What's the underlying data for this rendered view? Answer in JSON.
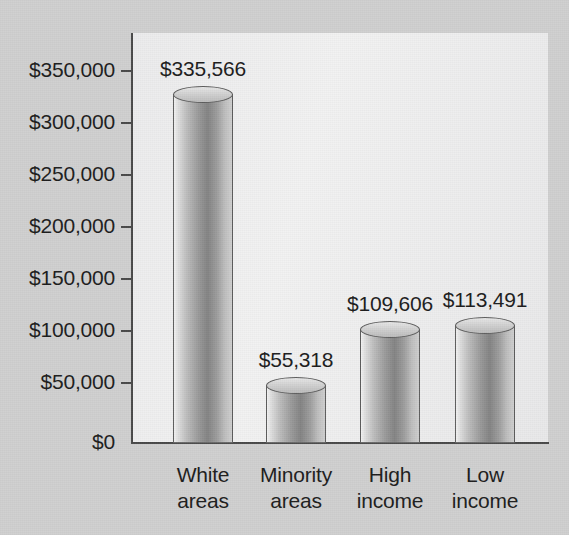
{
  "chart_data": {
    "type": "bar",
    "title": "",
    "subtitle": "",
    "xlabel": "",
    "ylabel": "",
    "categories": [
      "White areas",
      "Minority areas",
      "High income",
      "Low income"
    ],
    "category_lines": [
      [
        "White",
        "areas"
      ],
      [
        "Minority",
        "areas"
      ],
      [
        "High",
        "income"
      ],
      [
        "Low",
        "income"
      ]
    ],
    "values": [
      335566,
      55318,
      109606,
      113491
    ],
    "value_labels": [
      "$335,566",
      "$55,318",
      "$109,606",
      "$113,491"
    ],
    "ylim": [
      0,
      375000
    ],
    "ytick_values": [
      0,
      50000,
      100000,
      150000,
      200000,
      250000,
      300000,
      350000
    ],
    "ytick_labels": [
      "$0",
      "$50,000",
      "$100,000",
      "$150,000",
      "$200,000",
      "$250,000",
      "$300,000",
      "$350,000"
    ],
    "grid": false,
    "legend": null,
    "legend_position": "none",
    "bar_style": "3d-cylinder",
    "colors": {
      "page_background": "#d0d0d0",
      "plot_background": "#efefef",
      "axis": "#4a4a4a",
      "bar_light": "#f2f2f2",
      "bar_dark": "#848484",
      "text": "#1d1d1d"
    }
  }
}
